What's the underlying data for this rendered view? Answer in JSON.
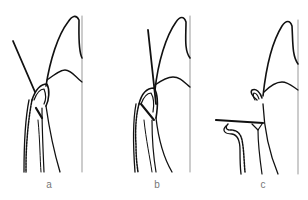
{
  "figure": {
    "panels": [
      {
        "id": "a",
        "label": "a",
        "description": "Probe angled into gingival sulcus, tip at bottom of pocket"
      },
      {
        "id": "b",
        "label": "b",
        "description": "Probe held parallel along tooth surface into sulcus"
      },
      {
        "id": "c",
        "label": "c",
        "description": "Probe inserted horizontally toward interdental area"
      }
    ],
    "colors": {
      "line": "#111111",
      "axis_line": "#999999",
      "label": "#777777",
      "background": "#ffffff"
    }
  }
}
